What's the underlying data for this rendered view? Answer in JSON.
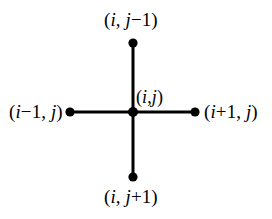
{
  "figure": {
    "type": "stencil-diagram",
    "background_color": "#ffffff",
    "stroke_color": "#000000"
  },
  "geometry": {
    "width": 272,
    "height": 219,
    "center": {
      "x": 133,
      "y": 112
    },
    "line_width": 3,
    "dot_radius_center": 5,
    "dot_radius_outer": 4.5,
    "arm_up_end": {
      "x": 133,
      "y": 43
    },
    "arm_down_end": {
      "x": 133,
      "y": 177
    },
    "arm_left_end": {
      "x": 70,
      "y": 112
    },
    "arm_right_end": {
      "x": 195,
      "y": 112
    }
  },
  "labels": {
    "top": {
      "open": "(",
      "i": "i",
      "comma": ", ",
      "j": "j",
      "op": "−1",
      "close": ")"
    },
    "bottom": {
      "open": "(",
      "i": "i",
      "comma": ", ",
      "j": "j",
      "op": "+1",
      "close": ")"
    },
    "left": {
      "open": "(",
      "i": "i",
      "op": "−1",
      "comma": ", ",
      "j": "j",
      "close": ")"
    },
    "right": {
      "open": "(",
      "i": "i",
      "op": "+1",
      "comma": ", ",
      "j": "j",
      "close": ")"
    },
    "center": {
      "open": "(",
      "i": "i",
      "comma": ",",
      "j": "j",
      "close": ")"
    }
  },
  "nodes": [
    {
      "name": "node-up",
      "label": "(i, j−1)"
    },
    {
      "name": "node-left",
      "label": "(i−1, j)"
    },
    {
      "name": "node-center",
      "label": "(i,j)"
    },
    {
      "name": "node-right",
      "label": "(i+1, j)"
    },
    {
      "name": "node-down",
      "label": "(i, j+1)"
    }
  ]
}
